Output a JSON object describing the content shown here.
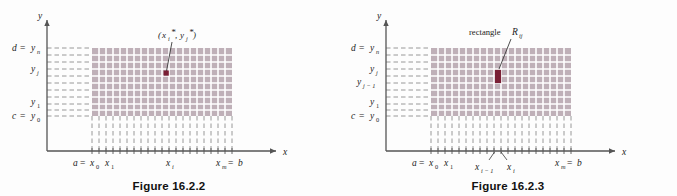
{
  "page": {
    "background": "#fdfdfd",
    "grid_fill": "#bfb0b8",
    "grid_line": "#ffffff",
    "dash_color": "#8c8c8c",
    "axis_color": "#555555",
    "highlight_color": "#7a1f35",
    "point_color": "#7a1f35"
  },
  "figures": [
    {
      "id": "figure-16-2-2",
      "caption": "Figure 16.2.2",
      "axis_x_label": "x",
      "axis_y_label": "y",
      "y_ticks": [
        {
          "label_main": "d",
          "eq": "=",
          "var": "y",
          "sub": "n"
        },
        {
          "label_main": "",
          "eq": "",
          "var": "y",
          "sub": "j"
        },
        {
          "label_main": "",
          "eq": "",
          "var": "y",
          "sub": "1"
        },
        {
          "label_main": "c",
          "eq": "=",
          "var": "y",
          "sub": "0"
        }
      ],
      "y_tick_texts": [
        "d = y n",
        "y j",
        "y 1",
        "c = y 0"
      ],
      "x_ticks": [
        {
          "label_main": "a",
          "eq": "=",
          "var": "x",
          "sub": "0"
        },
        {
          "label_main": "",
          "eq": "",
          "var": "x",
          "sub": "1"
        },
        {
          "label_main": "",
          "eq": "",
          "var": "x",
          "sub": "i"
        },
        {
          "label_main": "x",
          "eq": "=",
          "var": "b",
          "sub": "m"
        }
      ],
      "x_tick_texts": [
        "a = x 0",
        "x 1",
        "x i",
        "x m = b"
      ],
      "annotation": {
        "text": "(x i* , y j*)",
        "kind": "sample-point",
        "marker": "square"
      }
    },
    {
      "id": "figure-16-2-3",
      "caption": "Figure 16.2.3",
      "axis_x_label": "x",
      "axis_y_label": "y",
      "y_ticks": [
        {
          "label_main": "d",
          "eq": "=",
          "var": "y",
          "sub": "n"
        },
        {
          "label_main": "",
          "eq": "",
          "var": "y",
          "sub": "j"
        },
        {
          "label_main": "",
          "eq": "",
          "var": "y",
          "sub": "j-1"
        },
        {
          "label_main": "",
          "eq": "",
          "var": "y",
          "sub": "1"
        },
        {
          "label_main": "c",
          "eq": "=",
          "var": "y",
          "sub": "0"
        }
      ],
      "y_tick_texts": [
        "d = y n",
        "y j",
        "y j - 1",
        "y 1",
        "c = y 0"
      ],
      "x_ticks": [
        {
          "label_main": "a",
          "eq": "=",
          "var": "x",
          "sub": "0"
        },
        {
          "label_main": "",
          "eq": "",
          "var": "x",
          "sub": "1"
        },
        {
          "label_main": "",
          "eq": "",
          "var": "x",
          "sub": "i-1"
        },
        {
          "label_main": "",
          "eq": "",
          "var": "x",
          "sub": "i"
        },
        {
          "label_main": "x",
          "eq": "=",
          "var": "b",
          "sub": "m"
        }
      ],
      "x_tick_texts": [
        "a = x 0",
        "x 1",
        "x i - 1",
        "x i",
        "x m = b"
      ],
      "annotation": {
        "text": "rectangle R ij",
        "kind": "highlighted-rectangle",
        "marker": "filled-cell"
      }
    }
  ],
  "labels": {
    "fig2_caption": "Figure 16.2.2",
    "fig3_caption": "Figure 16.2.3",
    "axis_x": "x",
    "axis_y": "y",
    "d_letter": "d",
    "c_letter": "c",
    "a_letter": "a",
    "b_letter": "b",
    "eq": "=",
    "y_letter": "y",
    "x_letter": "x",
    "sub_n": "n",
    "sub_m": "m",
    "sub_j": "j",
    "sub_i": "i",
    "sub_0": "0",
    "sub_1": "1",
    "sub_j_minus_1": "j − 1",
    "sub_i_minus_1": "i − 1",
    "star": "*",
    "rect_word": "rectangle",
    "rect_R": "R",
    "rect_sub": "ij",
    "paren_open": "(",
    "paren_close": ")",
    "comma": ","
  }
}
